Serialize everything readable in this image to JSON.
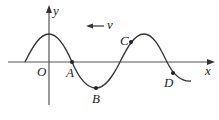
{
  "diagram": {
    "type": "transverse wave graph",
    "axes": {
      "x_label": "x",
      "y_label": "y",
      "origin_label": "O"
    },
    "velocity": {
      "label": "v",
      "direction": "left"
    },
    "points": [
      {
        "label": "A",
        "position": "on x-axis, descending"
      },
      {
        "label": "B",
        "position": "trough"
      },
      {
        "label": "C",
        "position": "rising, near crest"
      },
      {
        "label": "D",
        "position": "descending, below axis"
      }
    ],
    "colors": {
      "line": "#333333",
      "background": "#ffffff"
    }
  }
}
